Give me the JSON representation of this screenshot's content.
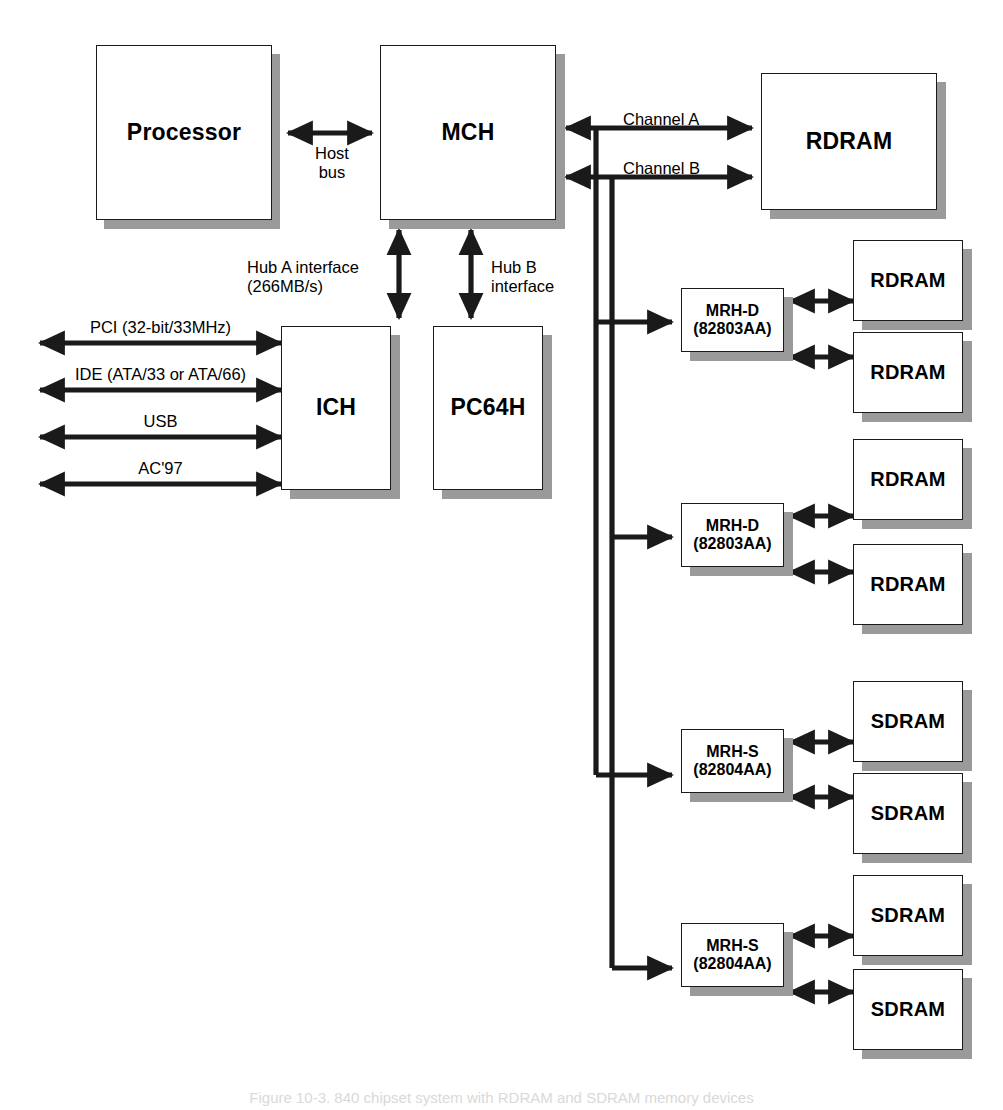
{
  "diagram": {
    "caption": "Figure 10-3. 840 chipset system with RDRAM and SDRAM memory devices",
    "colors": {
      "line": "#1a1a1a",
      "box_fill": "#ffffff",
      "box_border": "#1a1a1a",
      "shadow": "#9a9a9a",
      "background": "#ffffff"
    },
    "blocks": {
      "processor": {
        "label": "Processor"
      },
      "mch": {
        "label": "MCH"
      },
      "rdram_main": {
        "label": "RDRAM"
      },
      "ich": {
        "label": "ICH"
      },
      "pc64h": {
        "label": "PC64H"
      },
      "mrh_d_1": {
        "line1": "MRH-D",
        "line2": "(82803AA)"
      },
      "mrh_d_2": {
        "line1": "MRH-D",
        "line2": "(82803AA)"
      },
      "mrh_s_1": {
        "line1": "MRH-S",
        "line2": "(82804AA)"
      },
      "mrh_s_2": {
        "line1": "MRH-S",
        "line2": "(82804AA)"
      },
      "rdram_1": {
        "label": "RDRAM"
      },
      "rdram_2": {
        "label": "RDRAM"
      },
      "rdram_3": {
        "label": "RDRAM"
      },
      "rdram_4": {
        "label": "RDRAM"
      },
      "sdram_1": {
        "label": "SDRAM"
      },
      "sdram_2": {
        "label": "SDRAM"
      },
      "sdram_3": {
        "label": "SDRAM"
      },
      "sdram_4": {
        "label": "SDRAM"
      }
    },
    "connections": {
      "host_bus": {
        "line1": "Host",
        "line2": "bus"
      },
      "channel_a": {
        "label": "Channel A"
      },
      "channel_b": {
        "label": "Channel B"
      },
      "hub_a": {
        "line1": "Hub A interface",
        "line2": "(266MB/s)"
      },
      "hub_b": {
        "line1": "Hub B",
        "line2": "interface"
      },
      "pci": {
        "label": "PCI (32-bit/33MHz)"
      },
      "ide": {
        "label": "IDE (ATA/33 or ATA/66)"
      },
      "usb": {
        "label": "USB"
      },
      "ac97": {
        "label": "AC'97"
      }
    }
  }
}
